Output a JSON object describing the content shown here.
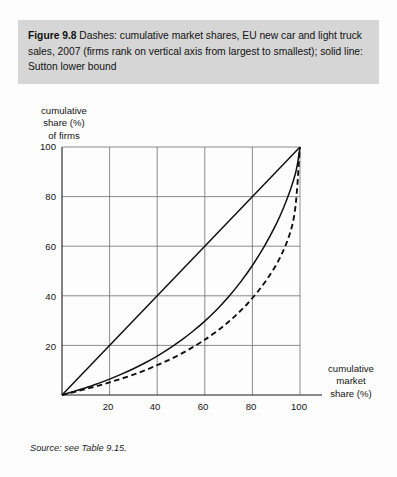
{
  "caption": {
    "figure_label": "Figure 9.8",
    "text": "Dashes: cumulative market shares, EU new car and light truck sales, 2007 (firms rank on vertical axis from largest to smallest); solid line: Sutton lower bound",
    "band_color": "#d6d6d6"
  },
  "source": {
    "text": "Source: see Table 9.15."
  },
  "axes": {
    "y_title": "cumulative\nshare (%)\nof firms",
    "x_title": "cumulative\nmarket\nshare (%)",
    "y_ticks": [
      "100",
      "80",
      "60",
      "40",
      "20"
    ],
    "x_ticks": [
      "20",
      "40",
      "60",
      "80",
      "100"
    ]
  },
  "chart_data": {
    "type": "line",
    "title": "Dashes: cumulative market shares, EU new car and light truck sales, 2007 (firms rank on vertical axis from largest to smallest); solid line: Sutton lower bound",
    "xlabel": "cumulative market share (%)",
    "ylabel": "cumulative share (%) of firms",
    "xlim": [
      0,
      100
    ],
    "ylim": [
      0,
      100
    ],
    "xticks": [
      20,
      40,
      60,
      80,
      100
    ],
    "yticks": [
      20,
      40,
      60,
      80,
      100
    ],
    "grid": true,
    "legend": "none",
    "line_color": "#111111",
    "series": [
      {
        "name": "45-degree diagonal",
        "style": "solid",
        "x": [
          0,
          100
        ],
        "y": [
          0,
          100
        ]
      },
      {
        "name": "Sutton lower bound",
        "style": "solid",
        "x": [
          0,
          5,
          10,
          15,
          20,
          25,
          30,
          35,
          40,
          45,
          50,
          55,
          60,
          65,
          70,
          75,
          80,
          85,
          90,
          93,
          96,
          98,
          99,
          100
        ],
        "y": [
          0,
          1.4,
          2.9,
          4.6,
          6.4,
          8.4,
          10.6,
          13.0,
          15.7,
          18.7,
          22.0,
          25.7,
          29.8,
          34.4,
          39.6,
          45.5,
          52.2,
          59.9,
          68.9,
          75.3,
          82.9,
          89.0,
          93.5,
          100
        ]
      },
      {
        "name": "Cumulative market shares (EU new car and light truck sales, 2007)",
        "style": "dashed",
        "x": [
          0,
          5,
          10,
          15,
          20,
          25,
          30,
          35,
          40,
          45,
          50,
          55,
          60,
          62,
          66,
          70,
          74,
          78,
          82,
          86,
          90,
          93,
          95,
          96.5,
          97.5,
          98.2,
          98.6,
          99,
          99.3,
          99.6,
          100
        ],
        "y": [
          0,
          1.2,
          2.4,
          3.7,
          5.1,
          6.6,
          8.2,
          10.0,
          12.0,
          14.2,
          16.6,
          19.3,
          22.3,
          23.6,
          26.4,
          29.5,
          33.0,
          36.9,
          41.4,
          46.5,
          52.5,
          58.2,
          63.0,
          67.5,
          72.0,
          77.0,
          81.0,
          86.0,
          90.5,
          95.0,
          100
        ]
      }
    ]
  }
}
